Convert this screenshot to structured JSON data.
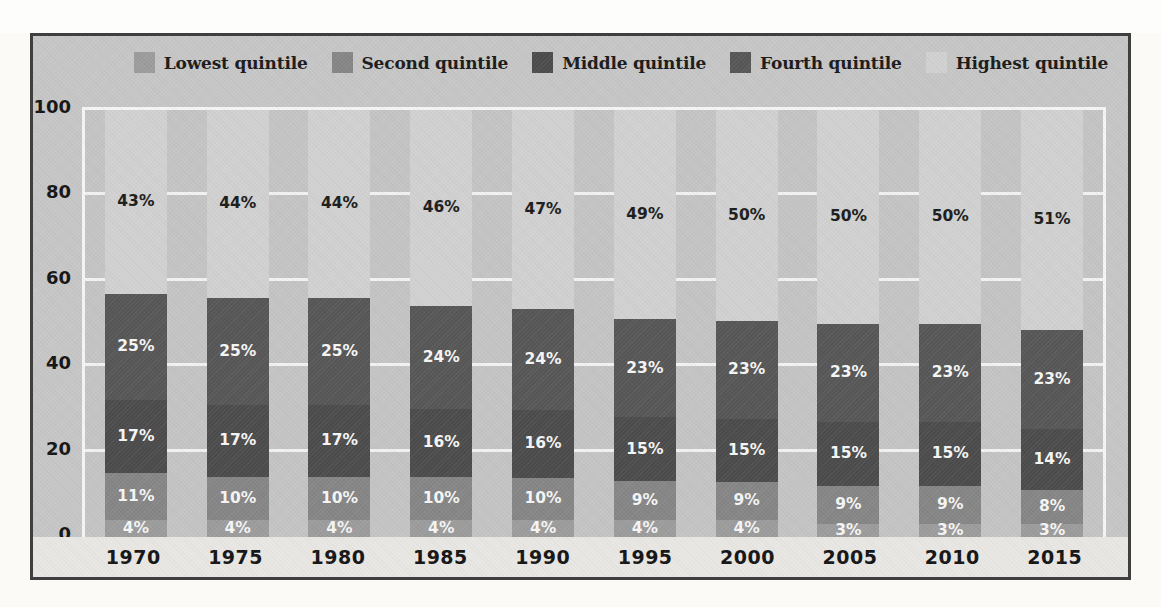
{
  "palette": {
    "figure_bg": "#c6c6c6",
    "plot_bg": "#c4c4c4",
    "axis_strip_bg": "#e8e7e4",
    "grid_color": "#f5f5f5",
    "frame_border": "#3f3f3f",
    "text_color": "#1b1b1b"
  },
  "chart_data": {
    "type": "bar",
    "stacked": true,
    "orientation": "vertical",
    "categories": [
      "1970",
      "1975",
      "1980",
      "1985",
      "1990",
      "1995",
      "2000",
      "2005",
      "2010",
      "2015"
    ],
    "series": [
      {
        "name": "Lowest quintile",
        "color": "#9c9c9c",
        "label_color": "#f6f6f6",
        "values": [
          4,
          4,
          4,
          4,
          4,
          4,
          4,
          3,
          3,
          3
        ]
      },
      {
        "name": "Second quintile",
        "color": "#868686",
        "label_color": "#f6f6f6",
        "values": [
          11,
          10,
          10,
          10,
          10,
          9,
          9,
          9,
          9,
          8
        ]
      },
      {
        "name": "Middle quintile",
        "color": "#4c4c4c",
        "label_color": "#f6f6f6",
        "values": [
          17,
          17,
          17,
          16,
          16,
          15,
          15,
          15,
          15,
          14
        ]
      },
      {
        "name": "Fourth quintile",
        "color": "#575757",
        "label_color": "#f6f6f6",
        "values": [
          25,
          25,
          25,
          24,
          24,
          23,
          23,
          23,
          23,
          23
        ]
      },
      {
        "name": "Highest quintile",
        "color": "#d1d1d1",
        "label_color": "#1c1c1c",
        "values": [
          43,
          44,
          44,
          46,
          47,
          49,
          50,
          50,
          50,
          51
        ]
      }
    ],
    "value_suffix": "%",
    "data_labels": "inside each segment",
    "title": "",
    "xlabel": "",
    "ylabel": "",
    "ylim": [
      0,
      100
    ],
    "yticks": [
      0,
      20,
      40,
      60,
      80,
      100
    ],
    "grid": "horizontal white lines at 20, 40, 60, 80",
    "legend_position": "top"
  }
}
